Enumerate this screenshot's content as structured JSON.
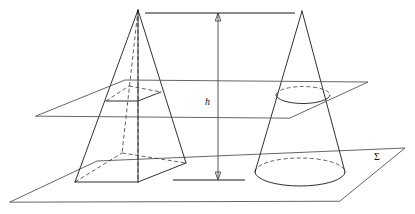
{
  "figure": {
    "background_color": "#ffffff",
    "line_color": "#1a1a1a",
    "hidden_line_color": "#3a3a3a",
    "plane_line_color": "#555555"
  },
  "labels": {
    "height_label": "h",
    "base_plane_label": "Σ"
  },
  "solids": {
    "pyramid": {
      "name": "square-pyramid",
      "apex": [
        138,
        10
      ],
      "base_front_left": [
        75,
        182
      ],
      "base_front_right": [
        138,
        182
      ],
      "base_right": [
        186,
        163
      ],
      "base_back": [
        122,
        153
      ],
      "cross_section_front_left": [
        106,
        101
      ],
      "cross_section_front_right": [
        138,
        101
      ],
      "cross_section_right": [
        161,
        92
      ],
      "cross_section_back": [
        129,
        86
      ]
    },
    "cone": {
      "name": "right-circular-cone",
      "apex": [
        302,
        11
      ],
      "base_center": [
        300,
        172
      ],
      "base_rx": 45,
      "base_ry": 14,
      "cross_section_center": [
        303,
        95
      ],
      "cross_section_rx": 27,
      "cross_section_ry": 8.5
    }
  },
  "planes": {
    "base_plane": {
      "name": "sigma-base-plane",
      "points": "10,202 97,161 405,148 340,201"
    },
    "cutting_plane": {
      "name": "cutting-plane",
      "points": "36,116 125,80 368,82 290,118"
    }
  },
  "dimension": {
    "name": "height-dimension",
    "arrow_x": 218,
    "top_y": 13,
    "bottom_y": 180,
    "top_tick": {
      "x1": 145,
      "x2": 295,
      "y": 13
    },
    "bottom_tick": {
      "x1": 173,
      "x2": 245,
      "y": 180
    },
    "label_pos": [
      210,
      102
    ]
  }
}
